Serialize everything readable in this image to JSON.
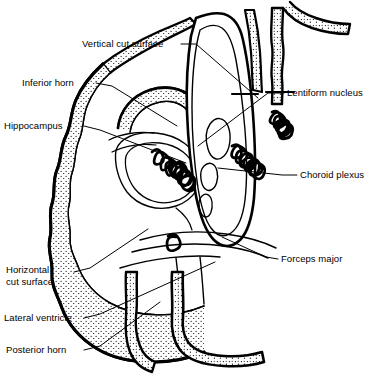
{
  "figure": {
    "kind": "anatomical-line-drawing",
    "background_color": "#ffffff",
    "ink_color": "#000000",
    "stipple_color": "#000000"
  },
  "labels": [
    {
      "id": "vertical-cut-surface",
      "text": "Vertical cut surface",
      "side": "left",
      "x": 82,
      "y": 38,
      "leader": [
        [
          181,
          44
        ],
        [
          196,
          44
        ],
        [
          258,
          98
        ]
      ]
    },
    {
      "id": "inferior-horn",
      "text": "Inferior horn",
      "side": "left",
      "x": 22,
      "y": 77,
      "leader": [
        [
          96,
          83
        ],
        [
          112,
          86
        ],
        [
          177,
          126
        ]
      ]
    },
    {
      "id": "hippocampus",
      "text": "Hippocampus",
      "side": "left",
      "x": 4,
      "y": 120,
      "leader": [
        [
          84,
          126
        ],
        [
          100,
          130
        ],
        [
          186,
          163
        ]
      ]
    },
    {
      "id": "lentiform-nucleus",
      "text": "Lentiform nucleus",
      "side": "right",
      "x": 287,
      "y": 87,
      "leader": [
        [
          284,
          93
        ],
        [
          268,
          93
        ],
        [
          198,
          146
        ]
      ]
    },
    {
      "id": "choroid-plexus",
      "text": "Choroid plexus",
      "side": "right",
      "x": 300,
      "y": 169,
      "leader": [
        [
          297,
          175
        ],
        [
          282,
          175
        ],
        [
          218,
          168
        ]
      ]
    },
    {
      "id": "forceps-major",
      "text": "Forceps major",
      "side": "right",
      "x": 281,
      "y": 253,
      "leader": [
        [
          278,
          259
        ],
        [
          266,
          257
        ],
        [
          222,
          237
        ]
      ]
    },
    {
      "id": "horizontal-cut-surface",
      "text": "Horizontal\ncut surface",
      "side": "left",
      "x": 6,
      "y": 264,
      "leader": [
        [
          74,
          272
        ],
        [
          90,
          268
        ],
        [
          148,
          229
        ]
      ]
    },
    {
      "id": "lateral-ventricle",
      "text": "Lateral ventricle",
      "side": "left",
      "x": 4,
      "y": 312,
      "leader": [
        [
          84,
          318
        ],
        [
          100,
          314
        ],
        [
          215,
          262
        ]
      ]
    },
    {
      "id": "posterior-horn",
      "text": "Posterior horn",
      "side": "left",
      "x": 6,
      "y": 344,
      "leader": [
        [
          84,
          350
        ],
        [
          100,
          346
        ],
        [
          160,
          302
        ]
      ]
    }
  ]
}
